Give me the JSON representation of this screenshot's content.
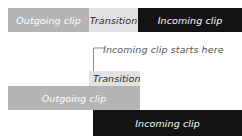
{
  "diagram": {
    "colors": {
      "outgoing_clip": "#b4b4b4",
      "transition": "#e2e2e2",
      "incoming_clip": "#131313",
      "annotation_text": "#555555",
      "background": "#ffffff",
      "leader_line": "#8a8a8a"
    },
    "top_timeline": {
      "blocks": [
        {
          "label": "Outgoing clip",
          "kind": "outgoing"
        },
        {
          "label": "Transition",
          "kind": "transition"
        },
        {
          "label": "Incoming clip",
          "kind": "incoming"
        }
      ]
    },
    "annotation": {
      "text": "Incoming clip starts here",
      "leader": "L-shaped leader line pointing down-left to transition start"
    },
    "bottom_timeline": {
      "blocks": [
        {
          "label": "Transition",
          "kind": "transition"
        },
        {
          "label": "Outgoing clip",
          "kind": "outgoing"
        },
        {
          "label": "Incoming clip",
          "kind": "incoming"
        }
      ]
    }
  }
}
